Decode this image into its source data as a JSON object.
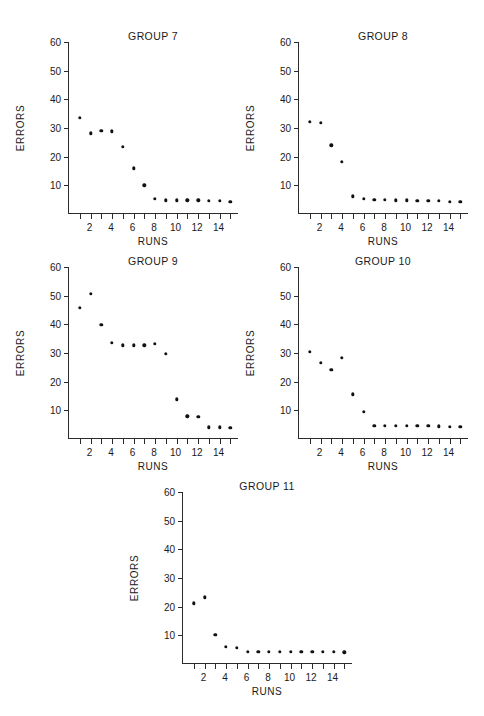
{
  "figure": {
    "background": "#ffffff",
    "marker_color": "#111111",
    "axis_color": "#2b2b2b",
    "layout": "five scatter panels: two rows of two, one centered panel on third row"
  },
  "common": {
    "xlabel": "RUNS",
    "ylabel": "ERRORS",
    "ytick_labels": [
      "10",
      "20",
      "30",
      "40",
      "50",
      "60"
    ],
    "ytick_values": [
      10,
      20,
      30,
      40,
      50,
      60
    ],
    "xtick_labels": [
      "2",
      "4",
      "6",
      "8",
      "10",
      "12",
      "14"
    ],
    "xtick_values": [
      2,
      4,
      6,
      8,
      10,
      12,
      14
    ],
    "xlim": [
      0,
      15.8
    ],
    "ylim": [
      0,
      60
    ],
    "x_values": [
      1,
      2,
      3,
      4,
      5,
      6,
      7,
      8,
      9,
      10,
      11,
      12,
      13,
      14,
      15
    ]
  },
  "chart_data": [
    {
      "type": "scatter",
      "title": "GROUP 7",
      "xlabel": "RUNS",
      "ylabel": "ERRORS",
      "xlim": [
        0,
        15.8
      ],
      "ylim": [
        0,
        60
      ],
      "grid": false,
      "legend": "none",
      "x": [
        1,
        2,
        3,
        4,
        5,
        6,
        7,
        8,
        9,
        10,
        11,
        12,
        13,
        14,
        15
      ],
      "values": [
        33.5,
        28.2,
        29.0,
        28.8,
        23.4,
        16.0,
        10.0,
        5.2,
        4.8,
        4.8,
        4.8,
        4.8,
        4.5,
        4.5,
        4.3
      ]
    },
    {
      "type": "scatter",
      "title": "GROUP 8",
      "xlabel": "RUNS",
      "ylabel": "ERRORS",
      "xlim": [
        0,
        15.8
      ],
      "ylim": [
        0,
        60
      ],
      "grid": false,
      "legend": "none",
      "x": [
        1,
        2,
        3,
        4,
        5,
        6,
        7,
        8,
        9,
        10,
        11,
        12,
        13,
        14,
        15
      ],
      "values": [
        32.2,
        31.8,
        24.0,
        18.2,
        6.2,
        5.2,
        4.9,
        4.9,
        4.8,
        4.8,
        4.7,
        4.6,
        4.5,
        4.3,
        4.2
      ]
    },
    {
      "type": "scatter",
      "title": "GROUP 9",
      "xlabel": "RUNS",
      "ylabel": "ERRORS",
      "xlim": [
        0,
        15.8
      ],
      "ylim": [
        0,
        60
      ],
      "grid": false,
      "legend": "none",
      "x": [
        1,
        2,
        3,
        4,
        5,
        6,
        7,
        8,
        9,
        10,
        11,
        12,
        13,
        14,
        15
      ],
      "values": [
        45.8,
        50.7,
        39.9,
        33.6,
        32.7,
        32.7,
        32.7,
        33.3,
        29.7,
        13.9,
        7.9,
        7.7,
        4.1,
        4.1,
        4.0
      ]
    },
    {
      "type": "scatter",
      "title": "GROUP 10",
      "xlabel": "RUNS",
      "ylabel": "ERRORS",
      "xlim": [
        0,
        15.8
      ],
      "ylim": [
        0,
        60
      ],
      "grid": false,
      "legend": "none",
      "x": [
        1,
        2,
        3,
        4,
        5,
        6,
        7,
        8,
        9,
        10,
        11,
        12,
        13,
        14,
        15
      ],
      "values": [
        30.5,
        26.6,
        24.2,
        28.4,
        15.6,
        9.5,
        4.7,
        4.7,
        4.7,
        4.7,
        4.6,
        4.5,
        4.4,
        4.2,
        4.2
      ]
    },
    {
      "type": "scatter",
      "title": "GROUP 11",
      "xlabel": "RUNS",
      "ylabel": "ERRORS",
      "xlim": [
        0,
        15.8
      ],
      "ylim": [
        0,
        60
      ],
      "grid": false,
      "legend": "none",
      "x": [
        1,
        2,
        3,
        4,
        5,
        6,
        7,
        8,
        9,
        10,
        11,
        12,
        13,
        14,
        15
      ],
      "values": [
        21.2,
        23.2,
        10.1,
        5.9,
        5.6,
        4.3,
        4.2,
        4.2,
        4.2,
        4.2,
        4.2,
        4.3,
        4.3,
        4.2,
        4.1
      ]
    }
  ],
  "panel_geometry": [
    {
      "left": 36,
      "top": 30,
      "plot_left": 32,
      "plot_top": 12,
      "plot_width": 170,
      "plot_height": 172
    },
    {
      "left": 266,
      "top": 30,
      "plot_left": 32,
      "plot_top": 12,
      "plot_width": 170,
      "plot_height": 172
    },
    {
      "left": 36,
      "top": 255,
      "plot_left": 32,
      "plot_top": 12,
      "plot_width": 170,
      "plot_height": 172
    },
    {
      "left": 266,
      "top": 255,
      "plot_left": 32,
      "plot_top": 12,
      "plot_width": 170,
      "plot_height": 172
    },
    {
      "left": 150,
      "top": 480,
      "plot_left": 32,
      "plot_top": 12,
      "plot_width": 170,
      "plot_height": 172
    }
  ]
}
